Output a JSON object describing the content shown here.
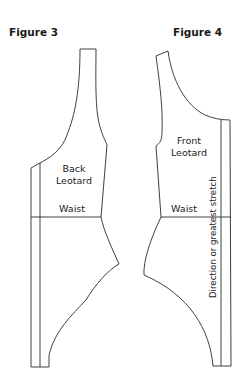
{
  "figures": [
    {
      "title": "Figure 3",
      "piece_label_line1": "Back",
      "piece_label_line2": "Leotard",
      "waist_label": "Waist"
    },
    {
      "title": "Figure 4",
      "piece_label_line1": "Front",
      "piece_label_line2": "Leotard",
      "waist_label": "Waist",
      "grain_label": "Direction or greatest stretch"
    }
  ],
  "colors": {
    "line": "#2a2a2a",
    "background": "#ffffff"
  }
}
